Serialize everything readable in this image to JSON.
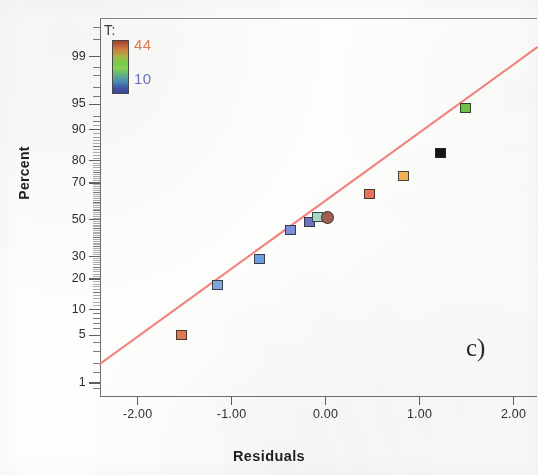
{
  "figure": {
    "panel_letter": "c)",
    "x_axis_title": "Residuals",
    "y_axis_title": "Percent"
  },
  "legend": {
    "title": "T:",
    "max_label": "44",
    "min_label": "10",
    "max_color": "#e8795a",
    "min_color": "#6b74c8",
    "icon": "vertical-colorbar"
  },
  "colors": {
    "reference_line": "#f4847e",
    "axis": "#6f6f6f",
    "text": "#2f2f2f",
    "paper": "#fdfdfb"
  },
  "chart_data": {
    "type": "scatter",
    "title": "",
    "subtitle": "",
    "xlabel": "Residuals",
    "ylabel": "Percent",
    "plot_kind": "normal-probability-plot",
    "grid": false,
    "legend_position": "top-left",
    "xlim": [
      -2.4,
      2.25
    ],
    "ylim_percent": [
      0.6,
      99.8
    ],
    "xticks": [
      -2.0,
      -1.0,
      0.0,
      1.0,
      2.0
    ],
    "xticklabels": [
      "-2.00",
      "-1.00",
      "0.00",
      "1.00",
      "2.00"
    ],
    "yticks": [
      99,
      95,
      90,
      80,
      70,
      50,
      30,
      20,
      10,
      5,
      1
    ],
    "yticklabels": [
      "99",
      "95",
      "90",
      "80",
      "70",
      "50",
      "30",
      "20",
      "10",
      "5",
      "1"
    ],
    "reference_line": {
      "label": "normal fit line",
      "x": [
        -2.4,
        2.25
      ],
      "percent": [
        2.0,
        99.3
      ],
      "color": "#f4847e"
    },
    "series": [
      {
        "name": "Residuals",
        "marker_colors_by_T": true,
        "points": [
          {
            "x": -1.53,
            "percent": 5.0,
            "color": "#e07a4e",
            "marker": "square",
            "T": 44
          },
          {
            "x": -1.15,
            "percent": 17.5,
            "color": "#7fa6dd",
            "marker": "square",
            "T": 13
          },
          {
            "x": -0.7,
            "percent": 29.0,
            "color": "#6f9fe0",
            "marker": "square",
            "T": 12
          },
          {
            "x": -0.37,
            "percent": 44.5,
            "color": "#7b8fd8",
            "marker": "square",
            "T": 14
          },
          {
            "x": -0.17,
            "percent": 48.5,
            "color": "#6b74c8",
            "marker": "square",
            "T": 11
          },
          {
            "x": -0.09,
            "percent": 51.5,
            "color": "#a6d9cb",
            "marker": "square",
            "T": 22
          },
          {
            "x": 0.02,
            "percent": 51.5,
            "color": "#a35c52",
            "marker": "circle",
            "T": 40
          },
          {
            "x": 0.47,
            "percent": 64.5,
            "color": "#e8725a",
            "marker": "square",
            "T": 37
          },
          {
            "x": 0.83,
            "percent": 73.5,
            "color": "#f0b44e",
            "marker": "square",
            "T": 30
          },
          {
            "x": 1.22,
            "percent": 83.0,
            "color": "#151515",
            "marker": "square",
            "T": 0
          },
          {
            "x": 1.49,
            "percent": 94.5,
            "color": "#72c44a",
            "marker": "square",
            "T": 24
          }
        ]
      }
    ]
  }
}
